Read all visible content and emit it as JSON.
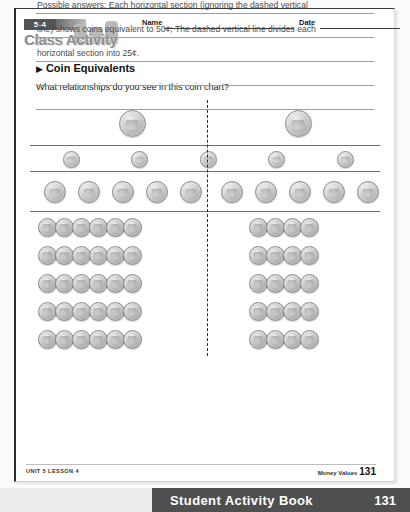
{
  "header": {
    "lesson_number": "5-4",
    "activity_label": "Class Activity",
    "name_label": "Name",
    "date_label": "Date"
  },
  "section": {
    "bullet": "▶",
    "title": "Coin Equivalents",
    "question": "What relationships do you see in this coin chart?"
  },
  "chart_data": {
    "type": "table",
    "divider": "dashed-vertical-line",
    "rows": [
      {
        "coin": "quarter",
        "value_cents": 25,
        "count": 2,
        "row_total_cents": 50,
        "per_side": 1
      },
      {
        "coin": "dime",
        "value_cents": 10,
        "count": 5,
        "row_total_cents": 50,
        "per_side": 2.5
      },
      {
        "coin": "nickel",
        "value_cents": 5,
        "count": 10,
        "row_total_cents": 50,
        "per_side": 5
      },
      {
        "coin": "penny",
        "value_cents": 1,
        "count": 50,
        "row_total_cents": 50,
        "per_side": 25
      }
    ],
    "penny_layout": {
      "rows": 5,
      "per_row": 10,
      "groups_per_row": 5,
      "coins_per_group": 2
    },
    "section_total_cents": 50,
    "half_section_total_cents": 25
  },
  "answers": {
    "line1": "Possible answers: Each horizontal section (ignoring the dashed vertical",
    "line2": "line) shows coins equivalent to 50¢; The dashed vertical line divides each",
    "line3": "horizontal section into 25¢.",
    "line4": "",
    "line5": ""
  },
  "footer": {
    "left": "UNIT 5 LESSON 4",
    "right_label": "Money Values",
    "page_number": "131"
  },
  "banner": {
    "title": "Student Activity Book",
    "page": "131"
  }
}
